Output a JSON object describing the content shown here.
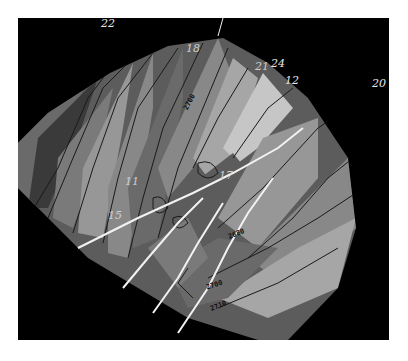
{
  "map": {
    "type": "structure contour map",
    "background_color": "#000000",
    "frame_color": "#ffffff",
    "contour_line_color": "#1a1a1a",
    "fault_line_color": "#f2f2f2",
    "fill_shades": [
      "#3a3a3a",
      "#4d4d4d",
      "#5c5c5c",
      "#6a6a6a",
      "#7a7a7a",
      "#888888",
      "#979797",
      "#a6a6a6",
      "#b5b5b5",
      "#c6c6c6"
    ],
    "wells": [
      {
        "id": "22",
        "label": "22"
      },
      {
        "id": "18",
        "label": "18"
      },
      {
        "id": "24",
        "label": "24"
      },
      {
        "id": "21",
        "label": "21"
      },
      {
        "id": "12",
        "label": "12"
      },
      {
        "id": "20",
        "label": "20"
      },
      {
        "id": "11",
        "label": "11"
      },
      {
        "id": "17",
        "label": "17"
      },
      {
        "id": "15",
        "label": "15"
      }
    ],
    "contour_labels": [
      {
        "value": "2700"
      },
      {
        "value": "2680"
      },
      {
        "value": "2700b",
        "text": "2700"
      },
      {
        "value": "2710"
      }
    ]
  }
}
